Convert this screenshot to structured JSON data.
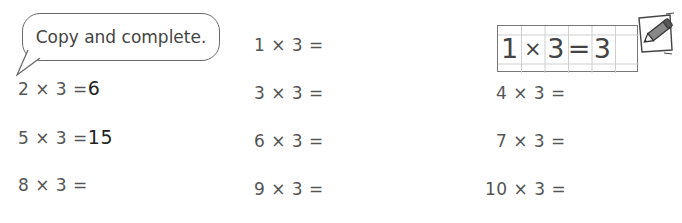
{
  "instruction": {
    "text": "Copy and complete."
  },
  "example": {
    "cells": [
      "1",
      "×",
      "3",
      "=",
      "3",
      ""
    ],
    "text": "1 × 3 = 3"
  },
  "equations": [
    {
      "id": "1x3",
      "text": "1 × 3 =",
      "answer": ""
    },
    {
      "id": "2x3",
      "text": "2 × 3 =",
      "answer": "6"
    },
    {
      "id": "3x3",
      "text": "3 × 3 =",
      "answer": ""
    },
    {
      "id": "4x3",
      "text": "4 × 3 =",
      "answer": ""
    },
    {
      "id": "5x3",
      "text": "5 × 3 =",
      "answer": "15"
    },
    {
      "id": "6x3",
      "text": "6 × 3 =",
      "answer": ""
    },
    {
      "id": "7x3",
      "text": "7 × 3 =",
      "answer": ""
    },
    {
      "id": "8x3",
      "text": "8 × 3 =",
      "answer": ""
    },
    {
      "id": "9x3",
      "text": "9 × 3 =",
      "answer": ""
    },
    {
      "id": "10x3",
      "text": "10 × 3 =",
      "answer": ""
    }
  ],
  "icons": {
    "pencil": "pencil-writing-icon"
  }
}
